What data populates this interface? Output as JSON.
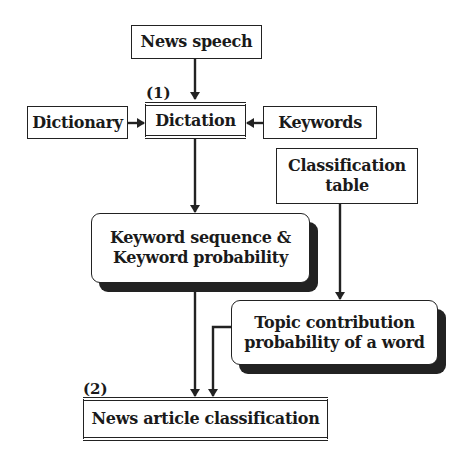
{
  "diagram": {
    "type": "flowchart",
    "nodes": {
      "news_speech": {
        "label": "News speech",
        "style": "plain"
      },
      "dictionary": {
        "label": "Dictionary",
        "style": "plain"
      },
      "dictation": {
        "label": "Dictation",
        "style": "double",
        "marker": "(1)"
      },
      "keywords": {
        "label": "Keywords",
        "style": "plain"
      },
      "classification_table": {
        "label_line1": "Classification",
        "label_line2": "table",
        "style": "plain"
      },
      "keyword_sequence": {
        "label_line1": "Keyword sequence &",
        "label_line2": "Keyword probability",
        "style": "rounded-shadow"
      },
      "topic_contribution": {
        "label_line1": "Topic contribution",
        "label_line2": "probability of a word",
        "style": "rounded-shadow"
      },
      "news_article_classification": {
        "label": "News article classification",
        "style": "double",
        "marker": "(2)"
      }
    },
    "edges": [
      {
        "from": "News speech",
        "to": "Dictation"
      },
      {
        "from": "Dictionary",
        "to": "Dictation"
      },
      {
        "from": "Keywords",
        "to": "Dictation"
      },
      {
        "from": "Dictation",
        "to": "Keyword sequence & Keyword probability"
      },
      {
        "from": "Classification table",
        "to": "Topic contribution probability of a word"
      },
      {
        "from": "Keyword sequence & Keyword probability",
        "to": "News article classification"
      },
      {
        "from": "Topic contribution probability of a word",
        "to": "News article classification"
      }
    ],
    "colors": {
      "ink": "#222222",
      "background": "#ffffff"
    }
  }
}
